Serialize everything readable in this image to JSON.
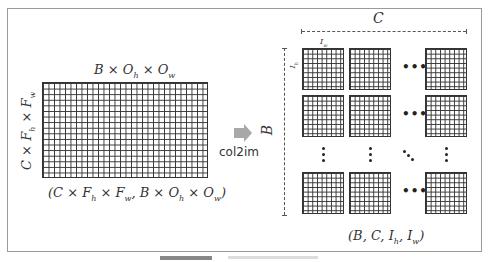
{
  "left": {
    "top_label": "B × O_h × O_w",
    "side_label": "C × F_h × F_w",
    "bottom_label": "(C × F_h × F_w, B × O_h × O_w)"
  },
  "operation": {
    "label": "col2im",
    "arrow_icon": "right-arrow-icon"
  },
  "right": {
    "top_dim_label": "C",
    "side_dim_label": "B",
    "cell_width_label": "I_w",
    "cell_height_label": "I_h",
    "bottom_label": "(B, C, I_h, I_w)",
    "hdots": "•••"
  },
  "colors": {
    "grid_line": "#333333",
    "arrow": "#a8a8a8",
    "frame_border": "#9a9a9a"
  }
}
